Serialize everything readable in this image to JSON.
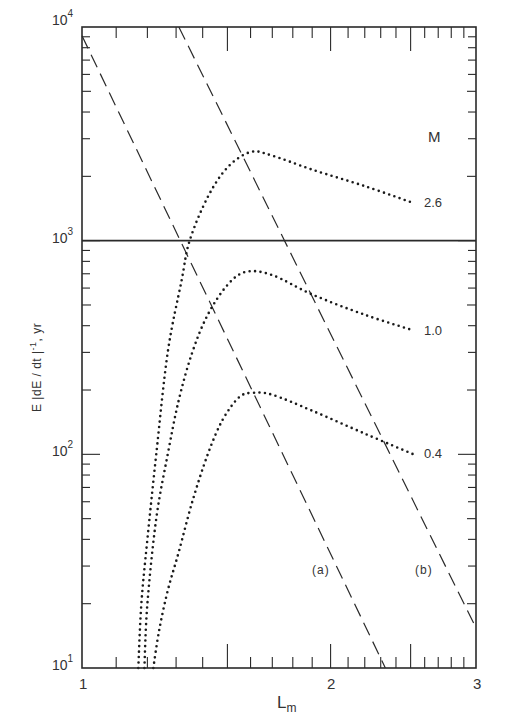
{
  "chart_data": {
    "type": "line",
    "title": "",
    "xlabel": "L_m",
    "ylabel": "E |dE / dt |^-1, yr",
    "xscale": "log",
    "yscale": "log",
    "xlim": [
      1,
      3
    ],
    "ylim": [
      10,
      10000
    ],
    "x_tick_labels": [
      "1",
      "2",
      "3"
    ],
    "y_tick_labels": [
      "10^1",
      "10^2",
      "10^3",
      "10^4"
    ],
    "grid": false,
    "legend_title": "M",
    "reference_lines": [
      {
        "type": "horizontal",
        "y": 1000,
        "style": "solid"
      }
    ],
    "series": [
      {
        "name": "2.6",
        "style": "dotted",
        "points": [
          [
            1.17,
            10
          ],
          [
            1.18,
            20
          ],
          [
            1.2,
            40
          ],
          [
            1.23,
            100
          ],
          [
            1.27,
            300
          ],
          [
            1.32,
            650
          ],
          [
            1.35,
            1000
          ],
          [
            1.42,
            1600
          ],
          [
            1.5,
            2200
          ],
          [
            1.6,
            2600
          ],
          [
            1.7,
            2500
          ],
          [
            1.9,
            2150
          ],
          [
            2.2,
            1800
          ],
          [
            2.52,
            1500
          ]
        ]
      },
      {
        "name": "1.0",
        "style": "dotted",
        "points": [
          [
            1.19,
            10
          ],
          [
            1.2,
            20
          ],
          [
            1.23,
            50
          ],
          [
            1.27,
            100
          ],
          [
            1.31,
            180
          ],
          [
            1.36,
            300
          ],
          [
            1.42,
            450
          ],
          [
            1.5,
            620
          ],
          [
            1.58,
            715
          ],
          [
            1.7,
            690
          ],
          [
            1.9,
            560
          ],
          [
            2.2,
            450
          ],
          [
            2.52,
            380
          ]
        ]
      },
      {
        "name": "0.4",
        "style": "dotted",
        "points": [
          [
            1.22,
            10
          ],
          [
            1.24,
            15
          ],
          [
            1.27,
            23
          ],
          [
            1.31,
            35
          ],
          [
            1.36,
            60
          ],
          [
            1.42,
            100
          ],
          [
            1.48,
            145
          ],
          [
            1.55,
            185
          ],
          [
            1.61,
            194
          ],
          [
            1.7,
            190
          ],
          [
            1.9,
            160
          ],
          [
            2.2,
            125
          ],
          [
            2.52,
            100
          ]
        ]
      }
    ],
    "lines": [
      {
        "name": "(a)",
        "style": "dashed",
        "points": [
          [
            1.0,
            9100
          ],
          [
            2.33,
            10
          ]
        ]
      },
      {
        "name": "(b)",
        "style": "dashed",
        "points": [
          [
            1.31,
            10000
          ],
          [
            3.0,
            15.4
          ]
        ]
      }
    ]
  },
  "labels": {
    "y_ticks": [
      {
        "base": "10",
        "exp": "4"
      },
      {
        "base": "10",
        "exp": "3"
      },
      {
        "base": "10",
        "exp": "2"
      },
      {
        "base": "10",
        "exp": "1"
      }
    ],
    "x_ticks": [
      "1",
      "2",
      "3"
    ],
    "ylabel_main": "E |dE / dt |",
    "ylabel_exp": "-1",
    "ylabel_unit": ", yr",
    "xlabel_main": "L",
    "xlabel_sub": "m",
    "legend_title": "M",
    "series_labels": [
      "2.6",
      "1.0",
      "0.4"
    ],
    "line_labels": [
      "(a)",
      "(b)"
    ]
  }
}
